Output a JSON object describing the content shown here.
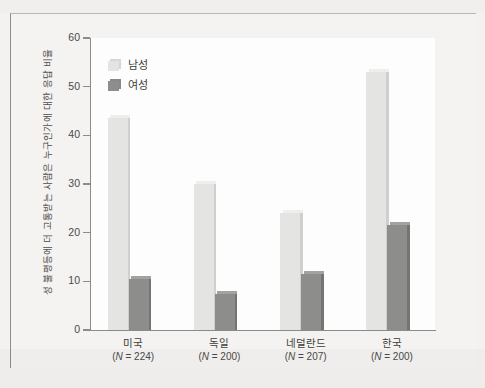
{
  "chart_data": {
    "type": "bar",
    "title": "",
    "xlabel": "",
    "ylabel": "성 불평등에 더 고통받는 사람은 누구인가에 대한 응답 비율",
    "ylim": [
      0,
      60
    ],
    "yticks": [
      0,
      10,
      20,
      30,
      40,
      50,
      60
    ],
    "grid": false,
    "legend_position": "top-left",
    "categories": [
      "미국",
      "독일",
      "네덜란드",
      "한국"
    ],
    "category_sublabels": [
      "(N = 224)",
      "(N = 200)",
      "(N = 207)",
      "(N = 200)"
    ],
    "series": [
      {
        "name": "남성",
        "color": "#e2e2e0",
        "values": [
          43.5,
          30.0,
          24.0,
          53.0
        ]
      },
      {
        "name": "여성",
        "color": "#8c8c8a",
        "values": [
          10.5,
          7.5,
          11.5,
          21.5
        ]
      }
    ]
  },
  "axis": {
    "tick_labels": [
      "60",
      "50",
      "40",
      "30",
      "20",
      "10",
      "0"
    ]
  },
  "legend": {
    "items": [
      {
        "label": "남성"
      },
      {
        "label": "여성"
      }
    ]
  },
  "colors": {
    "male_face": "#e4e4e2",
    "male_top": "#eeeeec",
    "male_side": "#cfcfcd",
    "female_face": "#8d8d8b",
    "female_top": "#a2a2a0",
    "female_side": "#747472",
    "axis": "#8c8b89",
    "text": "#3f3e3c",
    "plot_background": "#fdfdfd",
    "page_background": "#f3f2f0"
  }
}
